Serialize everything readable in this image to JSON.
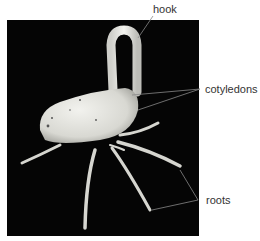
{
  "diagram": {
    "labels": {
      "hook": "hook",
      "cotyledons": "cotyledons",
      "roots": "roots"
    },
    "colors": {
      "background": "#050505",
      "seed": "#e8e8e4",
      "leader_line": "#888888",
      "label_text": "#333333"
    }
  }
}
